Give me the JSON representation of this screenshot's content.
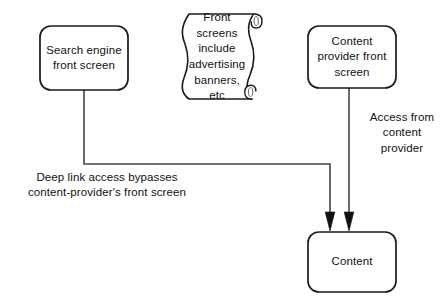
{
  "diagram": {
    "background_color": "#ffffff",
    "stroke_color": "#1a1a1a",
    "fill_color": "#ffffff",
    "nodes": [
      {
        "id": "search-engine-front-screen",
        "shape": "rounded-rectangle",
        "label": "Search engine\nfront screen",
        "x": 40,
        "y": 26,
        "width": 88,
        "height": 64
      },
      {
        "id": "front-screens-note",
        "shape": "scroll",
        "label": "Front\nscreens\ninclude\nadvertising\nbanners, etc",
        "x": 182,
        "y": 14,
        "width": 82,
        "height": 86
      },
      {
        "id": "content-provider-front-screen",
        "shape": "rounded-rectangle",
        "label": "Content\nprovider front\nscreen",
        "x": 308,
        "y": 26,
        "width": 88,
        "height": 62
      },
      {
        "id": "content",
        "shape": "rounded-rectangle",
        "label": "Content",
        "x": 308,
        "y": 232,
        "width": 88,
        "height": 60
      }
    ],
    "edges": [
      {
        "id": "deep-link-edge",
        "from": "search-engine-front-screen",
        "to": "content",
        "style": "elbow",
        "arrowhead": "filled-triangle",
        "label": "Deep link access bypasses\ncontent-provider's front screen"
      },
      {
        "id": "content-provider-edge",
        "from": "content-provider-front-screen",
        "to": "content",
        "style": "straight-vertical",
        "arrowhead": "filled-triangle",
        "label": "Access from\ncontent\nprovider"
      }
    ]
  }
}
